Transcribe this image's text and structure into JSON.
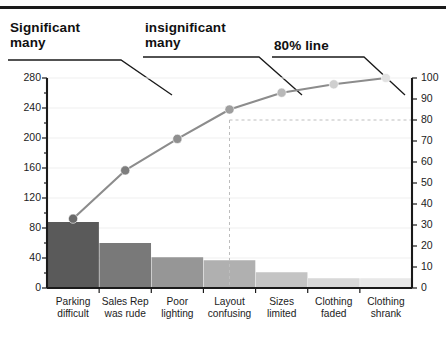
{
  "annotations": [
    {
      "id": "significant-many",
      "line1": "Significant",
      "line2": "many"
    },
    {
      "id": "insignificant-many",
      "line1": "insignificant",
      "line2": "many"
    },
    {
      "id": "eighty-percent-line",
      "line1": "80% line",
      "line2": ""
    }
  ],
  "colors": {
    "axis": "#1a1a1a",
    "line": "#8c8c8c",
    "leader": "#1a1a1a",
    "grid": "#efefef",
    "dashed": "#bdbdbd"
  },
  "chart_data": {
    "type": "bar",
    "title": "",
    "subtitle": "",
    "xlabel": "",
    "ylabel": "",
    "categories": [
      "Parking difficult",
      "Sales Rep was rude",
      "Poor lighting",
      "Layout confusing",
      "Sizes limited",
      "Clothing faded",
      "Clothing shrank"
    ],
    "category_lines": [
      [
        "Parking",
        "difficult"
      ],
      [
        "Sales Rep",
        "was rude"
      ],
      [
        "Poor",
        "lighting"
      ],
      [
        "Layout",
        "confusing"
      ],
      [
        "Sizes",
        "limited"
      ],
      [
        "Clothing",
        "faded"
      ],
      [
        "Clothing",
        "shrank"
      ]
    ],
    "series": [
      {
        "name": "Frequency",
        "type": "bar",
        "values": [
          88,
          60,
          41,
          37,
          21,
          13,
          13
        ],
        "bar_colors": [
          "#5a5a5a",
          "#797979",
          "#969696",
          "#b0b0b0",
          "#c4c4c4",
          "#d8d8d8",
          "#e8e8e8"
        ]
      },
      {
        "name": "Cumulative %",
        "type": "line",
        "values": [
          33,
          56,
          71,
          85,
          93,
          97,
          100
        ],
        "marker_colors": [
          "#6a6a6a",
          "#7d7d7d",
          "#8f8f8f",
          "#9e9e9e",
          "#b8b8b8",
          "#cfcfcf",
          "#e2e2e2"
        ]
      }
    ],
    "ylim": [
      0,
      280
    ],
    "yticks": [
      0,
      40,
      80,
      120,
      160,
      200,
      240,
      280
    ],
    "ytick_labels": [
      "0",
      "40",
      "80",
      "120",
      "160",
      "200",
      "240",
      "280"
    ],
    "y2lim": [
      0,
      100
    ],
    "y2ticks": [
      0,
      10,
      20,
      30,
      40,
      50,
      60,
      70,
      80,
      90,
      100
    ],
    "y2tick_labels": [
      "0",
      "10",
      "20",
      "30",
      "40",
      "50",
      "60",
      "70",
      "80",
      "90",
      "100"
    ],
    "reference_line": {
      "label": "80% line",
      "value": 80,
      "style": "dashed"
    },
    "grid": true,
    "legend": "none"
  }
}
